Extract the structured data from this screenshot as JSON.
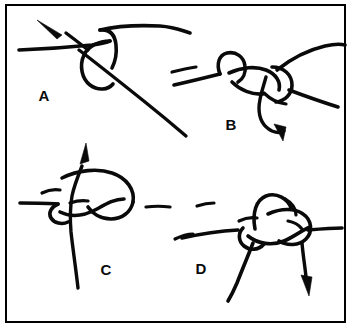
{
  "figure": {
    "background_color": "#ffffff",
    "ink_color": "#0a0a0a",
    "border_color": "#000000",
    "border_width_px": 2,
    "width_px": 355,
    "height_px": 329
  },
  "panels": [
    {
      "id": "panel-a",
      "label": "A",
      "label_x": 44,
      "label_y": 101,
      "caption": "Step A: working end crossed over standing line forming an open loop, arrow indicates direction of pull up and to the left",
      "arrow_direction": "up-left"
    },
    {
      "id": "panel-b",
      "label": "B",
      "label_x": 231,
      "label_y": 130,
      "caption": "Step B: working end wrapped a second turn and tucked through, arrow indicates direction of pull downward",
      "arrow_direction": "down"
    },
    {
      "id": "panel-c",
      "label": "C",
      "label_x": 106,
      "label_y": 275,
      "caption": "Step C: loop opened out with the end passing up through it, arrow indicates direction of pull upward",
      "arrow_direction": "up"
    },
    {
      "id": "panel-d",
      "label": "D",
      "label_x": 201,
      "label_y": 274,
      "caption": "Step D: knot drawn snug around the standing line, arrow indicates direction of pull downward",
      "arrow_direction": "down"
    }
  ]
}
